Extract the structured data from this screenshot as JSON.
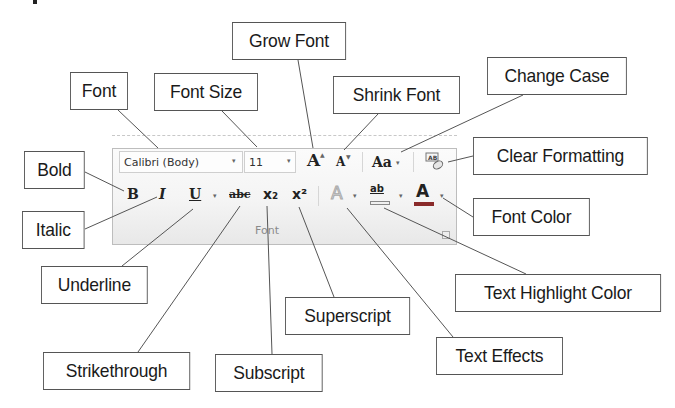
{
  "ribbon": {
    "group_label": "Font",
    "font_name": "Calibri (Body)",
    "font_size": "11",
    "grow_font_glyph": "A",
    "shrink_font_glyph": "A",
    "change_case_glyph": "Aa",
    "clear_formatting_glyph": "AB",
    "bold_glyph": "B",
    "italic_glyph": "I",
    "underline_glyph": "U",
    "strikethrough_glyph": "abc",
    "subscript_glyph": "x₂",
    "superscript_glyph": "x²",
    "text_effects_glyph": "A",
    "highlight_glyph": "ab",
    "font_color_glyph": "A",
    "dropdown_glyph": "▾",
    "colors": {
      "font_color_bar": "#b03030",
      "highlight_bar": "#f0f0f0",
      "panel_bg": "#f4f4f4",
      "panel_border": "#bdbdbd"
    }
  },
  "callouts": {
    "font": "Font",
    "font_size": "Font Size",
    "grow_font": "Grow Font",
    "shrink_font": "Shrink Font",
    "change_case": "Change Case",
    "clear_formatting": "Clear Formatting",
    "bold": "Bold",
    "italic": "Italic",
    "font_color": "Font Color",
    "underline": "Underline",
    "text_highlight_color": "Text Highlight Color",
    "superscript": "Superscript",
    "text_effects": "Text Effects",
    "strikethrough": "Strikethrough",
    "subscript": "Subscript"
  }
}
